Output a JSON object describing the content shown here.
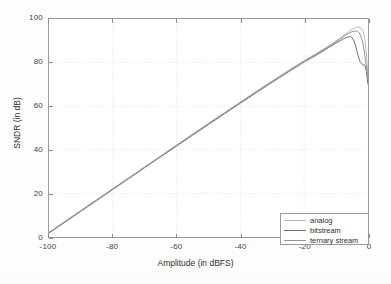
{
  "chart_data": {
    "type": "line",
    "title": "",
    "xlabel": "Amplitude (in dBFS)",
    "ylabel": "SNDR (in dB)",
    "xlim": [
      -100,
      0
    ],
    "ylim": [
      0,
      100
    ],
    "xticks": [
      -100,
      -80,
      -60,
      -40,
      -20,
      0
    ],
    "xticklabels": [
      "-100",
      "-80",
      "-60",
      "-40",
      "-20",
      "0"
    ],
    "yticks": [
      0,
      20,
      40,
      60,
      80,
      100
    ],
    "yticklabels": [
      "0",
      "20",
      "40",
      "60",
      "80",
      "100"
    ],
    "grid": true,
    "grid_style": "dotted",
    "legend_position": "lower right",
    "series": [
      {
        "name": "analog",
        "color": "#b9b9b9",
        "x": [
          -100,
          -95,
          -90,
          -85,
          -80,
          -75,
          -70,
          -65,
          -60,
          -55,
          -50,
          -45,
          -40,
          -35,
          -30,
          -25,
          -20,
          -16,
          -12,
          -9,
          -7,
          -5,
          -4,
          -3,
          -2.5,
          -2,
          -1.5,
          -1,
          -0.5,
          0
        ],
        "y": [
          2.2,
          7.2,
          12.2,
          17.2,
          22.2,
          27.2,
          32.2,
          37.2,
          42.2,
          47.2,
          52.2,
          57.1,
          62.0,
          66.9,
          71.7,
          76.4,
          81.0,
          84.4,
          88.0,
          91.0,
          93.2,
          95.3,
          96.0,
          96.3,
          96.2,
          95.6,
          94.2,
          91.0,
          84.0,
          74.0
        ]
      },
      {
        "name": "bitstream",
        "color": "#6e6e6e",
        "x": [
          -100,
          -95,
          -90,
          -85,
          -80,
          -75,
          -70,
          -65,
          -60,
          -55,
          -50,
          -45,
          -40,
          -35,
          -30,
          -25,
          -20,
          -16,
          -12,
          -10,
          -8,
          -7,
          -6,
          -5.5,
          -5,
          -4.5,
          -4,
          -3.5,
          -3,
          -2.5,
          -2,
          -1.5,
          -1,
          -0.5,
          0
        ],
        "y": [
          1.8,
          6.8,
          11.8,
          16.8,
          21.8,
          26.8,
          31.8,
          36.8,
          41.7,
          46.7,
          51.6,
          56.5,
          61.4,
          66.2,
          71.0,
          75.7,
          80.3,
          83.6,
          87.2,
          89.0,
          90.7,
          91.4,
          91.8,
          91.9,
          91.5,
          90.3,
          88.2,
          85.5,
          82.5,
          80.5,
          79.5,
          79.0,
          78.8,
          76.0,
          70.0
        ]
      },
      {
        "name": "ternary stream",
        "color": "#949494",
        "x": [
          -100,
          -95,
          -90,
          -85,
          -80,
          -75,
          -70,
          -65,
          -60,
          -55,
          -50,
          -45,
          -40,
          -35,
          -30,
          -25,
          -20,
          -16,
          -12,
          -9,
          -7,
          -5,
          -4,
          -3.5,
          -3,
          -2.5,
          -2,
          -1.5,
          -1,
          -0.5,
          0
        ],
        "y": [
          2.0,
          7.0,
          12.0,
          17.0,
          22.0,
          27.0,
          32.0,
          37.0,
          42.0,
          47.0,
          51.9,
          56.8,
          61.7,
          66.5,
          71.3,
          76.0,
          80.6,
          84.0,
          87.6,
          90.6,
          92.6,
          94.2,
          94.5,
          94.4,
          94.0,
          93.0,
          91.2,
          88.0,
          83.5,
          78.0,
          72.0
        ]
      }
    ]
  },
  "legend": {
    "entries": [
      {
        "label": "analog"
      },
      {
        "label": "bitstream"
      },
      {
        "label": "ternary stream"
      }
    ]
  }
}
